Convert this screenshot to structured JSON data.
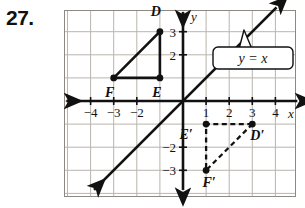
{
  "problem": {
    "number": "27."
  },
  "figure": {
    "grid": {
      "x_min": -5,
      "x_max": 5,
      "y_min": -4,
      "y_max": 4,
      "visible": true
    },
    "axes": {
      "x_axis_label": "x",
      "y_axis_label": "y",
      "x_ticks": [
        {
          "value": -4,
          "label": "−4"
        },
        {
          "value": -3,
          "label": "−3"
        },
        {
          "value": -2,
          "label": "−2"
        },
        {
          "value": 1,
          "label": "1"
        },
        {
          "value": 2,
          "label": "2"
        },
        {
          "value": 3,
          "label": "3"
        },
        {
          "value": 4,
          "label": "4"
        }
      ],
      "y_ticks": [
        {
          "value": 3,
          "label": "3"
        },
        {
          "value": 2,
          "label": "2"
        },
        {
          "value": -2,
          "label": "−2"
        },
        {
          "value": -3,
          "label": "−3"
        }
      ]
    },
    "line": {
      "equation_label": "y = x",
      "slope": 1,
      "intercept": 0,
      "style": "solid-double-arrow"
    },
    "preimage": {
      "name": "triangle-DEF",
      "style": "solid",
      "vertices": [
        {
          "name": "D",
          "label": "D",
          "x": -1,
          "y": 3,
          "label_dx": -4,
          "label_dy": -16
        },
        {
          "name": "F",
          "label": "F",
          "x": -3,
          "y": 1,
          "label_dx": -4,
          "label_dy": 19
        },
        {
          "name": "E",
          "label": "E",
          "x": -1,
          "y": 1,
          "label_dx": -3,
          "label_dy": 19
        }
      ]
    },
    "image": {
      "name": "triangle-D-prime-E-prime-F-prime",
      "style": "dashed",
      "vertices": [
        {
          "name": "D-prime",
          "label": "D′",
          "x": 3,
          "y": -1,
          "label_dx": 5,
          "label_dy": 16
        },
        {
          "name": "E-prime",
          "label": "E′",
          "x": 1,
          "y": -1,
          "label_dx": -20,
          "label_dy": 15
        },
        {
          "name": "F-prime",
          "label": "F′",
          "x": 1,
          "y": -3,
          "label_dx": 3,
          "label_dy": 17
        }
      ]
    },
    "colors": {
      "ink": "#111111",
      "grid_line": "#b9b4ae",
      "grid_border": "#8d8880",
      "background": "#ffffff"
    }
  }
}
